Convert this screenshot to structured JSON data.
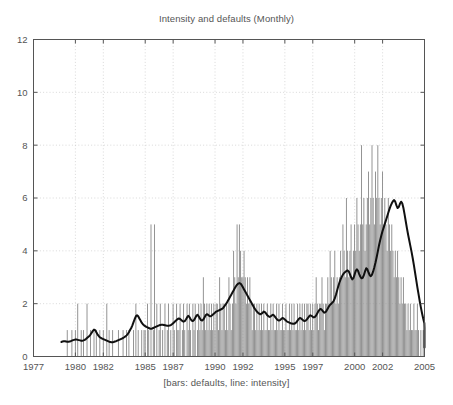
{
  "chart_data": {
    "type": "bar",
    "title": "Intensity and defaults (Monthly)",
    "xlabel": "[bars: defaults, line: intensity]",
    "ylabel": "",
    "grid": true,
    "legend": "none",
    "legend_note": "[bars: defaults, line: intensity]",
    "xlim": [
      1977,
      2005
    ],
    "ylim": [
      0,
      12
    ],
    "yticks": [
      0,
      2,
      4,
      6,
      8,
      10,
      12
    ],
    "ytick_labels": [
      "0",
      "2",
      "4",
      "6",
      "8",
      "10",
      "12"
    ],
    "xticks": [
      1977,
      1980,
      1982,
      1985,
      1987,
      1990,
      1992,
      1995,
      1997,
      2000,
      2002,
      2005
    ],
    "xtick_labels": [
      "1977",
      "1980",
      "1982",
      "1985",
      "1987",
      "1990",
      "1992",
      "1995",
      "1997",
      "2000",
      "2002",
      "2005"
    ],
    "bar_color": "#8c8c8c",
    "line_color": "#101010",
    "axis_color": "#555555",
    "grid_color": "#c8c8c8",
    "series": [
      {
        "name": "defaults",
        "type": "bar",
        "x_start": 1979.0,
        "x_step": 0.0833,
        "values": [
          0,
          0,
          0,
          0,
          0,
          1,
          0,
          0,
          0,
          1,
          0,
          0,
          1,
          0,
          2,
          0,
          0,
          1,
          0,
          1,
          0,
          0,
          2,
          0,
          0,
          1,
          0,
          0,
          1,
          0,
          1,
          0,
          0,
          1,
          0,
          0,
          1,
          0,
          0,
          2,
          0,
          1,
          0,
          0,
          1,
          0,
          0,
          0,
          0,
          1,
          0,
          0,
          0,
          1,
          0,
          0,
          1,
          0,
          1,
          0,
          0,
          0,
          1,
          0,
          2,
          0,
          1,
          0,
          0,
          1,
          0,
          1,
          1,
          0,
          2,
          1,
          0,
          5,
          0,
          1,
          5,
          0,
          2,
          0,
          1,
          2,
          0,
          1,
          0,
          2,
          0,
          1,
          2,
          0,
          1,
          0,
          2,
          1,
          0,
          2,
          1,
          1,
          2,
          0,
          1,
          2,
          1,
          0,
          2,
          1,
          2,
          1,
          0,
          2,
          1,
          2,
          0,
          1,
          2,
          1,
          2,
          1,
          3,
          2,
          1,
          2,
          1,
          2,
          1,
          2,
          1,
          2,
          1,
          2,
          2,
          1,
          3,
          2,
          1,
          2,
          2,
          1,
          2,
          1,
          3,
          2,
          1,
          2,
          4,
          3,
          2,
          5,
          3,
          5,
          4,
          3,
          3,
          4,
          3,
          2,
          3,
          2,
          3,
          2,
          1,
          2,
          2,
          1,
          2,
          1,
          2,
          1,
          2,
          1,
          2,
          1,
          1,
          2,
          1,
          1,
          2,
          1,
          2,
          1,
          1,
          2,
          1,
          2,
          1,
          1,
          2,
          1,
          1,
          2,
          1,
          1,
          2,
          1,
          2,
          1,
          2,
          1,
          1,
          2,
          1,
          2,
          1,
          2,
          1,
          2,
          1,
          2,
          2,
          1,
          2,
          1,
          2,
          1,
          2,
          3,
          2,
          1,
          2,
          2,
          3,
          2,
          1,
          2,
          2,
          3,
          2,
          4,
          3,
          2,
          3,
          4,
          2,
          3,
          2,
          3,
          4,
          3,
          5,
          4,
          3,
          6,
          4,
          3,
          4,
          5,
          3,
          4,
          5,
          4,
          6,
          5,
          4,
          5,
          8,
          5,
          6,
          4,
          5,
          6,
          7,
          5,
          6,
          8,
          6,
          5,
          7,
          6,
          8,
          6,
          5,
          6,
          7,
          5,
          6,
          5,
          4,
          6,
          5,
          4,
          5,
          4,
          3,
          4,
          3,
          4,
          3,
          2,
          3,
          2,
          3,
          2,
          2,
          1,
          2,
          1,
          2,
          1,
          1,
          2,
          1,
          1,
          2,
          1,
          0,
          1,
          0,
          1,
          0,
          0,
          1,
          0,
          0,
          0,
          0,
          0,
          0,
          0,
          0,
          0
        ]
      },
      {
        "name": "intensity",
        "type": "line",
        "x_start": 1979.0,
        "x_step": 0.0833,
        "values": [
          0.55,
          0.57,
          0.58,
          0.58,
          0.57,
          0.56,
          0.56,
          0.57,
          0.58,
          0.6,
          0.62,
          0.63,
          0.64,
          0.64,
          0.63,
          0.62,
          0.61,
          0.6,
          0.6,
          0.61,
          0.63,
          0.66,
          0.7,
          0.74,
          0.78,
          0.83,
          0.9,
          0.97,
          1.02,
          1.0,
          0.92,
          0.84,
          0.78,
          0.73,
          0.7,
          0.68,
          0.66,
          0.64,
          0.62,
          0.6,
          0.58,
          0.56,
          0.55,
          0.54,
          0.54,
          0.55,
          0.57,
          0.58,
          0.6,
          0.62,
          0.64,
          0.66,
          0.68,
          0.7,
          0.73,
          0.76,
          0.8,
          0.85,
          0.92,
          1.0,
          1.08,
          1.18,
          1.3,
          1.42,
          1.52,
          1.56,
          1.52,
          1.44,
          1.36,
          1.28,
          1.22,
          1.18,
          1.15,
          1.12,
          1.1,
          1.08,
          1.06,
          1.05,
          1.06,
          1.08,
          1.1,
          1.12,
          1.14,
          1.16,
          1.18,
          1.19,
          1.2,
          1.2,
          1.19,
          1.18,
          1.17,
          1.16,
          1.16,
          1.17,
          1.19,
          1.22,
          1.26,
          1.3,
          1.34,
          1.38,
          1.42,
          1.44,
          1.42,
          1.38,
          1.34,
          1.32,
          1.34,
          1.4,
          1.48,
          1.54,
          1.5,
          1.42,
          1.36,
          1.34,
          1.38,
          1.46,
          1.54,
          1.58,
          1.52,
          1.44,
          1.38,
          1.36,
          1.4,
          1.48,
          1.56,
          1.6,
          1.58,
          1.54,
          1.52,
          1.54,
          1.58,
          1.62,
          1.66,
          1.7,
          1.72,
          1.74,
          1.76,
          1.78,
          1.8,
          1.84,
          1.9,
          1.96,
          2.02,
          2.1,
          2.18,
          2.26,
          2.34,
          2.42,
          2.5,
          2.58,
          2.66,
          2.72,
          2.76,
          2.78,
          2.76,
          2.7,
          2.62,
          2.54,
          2.46,
          2.38,
          2.3,
          2.22,
          2.14,
          2.06,
          1.98,
          1.9,
          1.82,
          1.76,
          1.7,
          1.66,
          1.62,
          1.6,
          1.62,
          1.66,
          1.7,
          1.68,
          1.62,
          1.56,
          1.52,
          1.5,
          1.52,
          1.56,
          1.58,
          1.54,
          1.48,
          1.42,
          1.38,
          1.36,
          1.38,
          1.42,
          1.46,
          1.44,
          1.4,
          1.36,
          1.32,
          1.3,
          1.28,
          1.26,
          1.25,
          1.24,
          1.24,
          1.26,
          1.3,
          1.36,
          1.42,
          1.46,
          1.44,
          1.4,
          1.36,
          1.34,
          1.36,
          1.4,
          1.46,
          1.52,
          1.56,
          1.54,
          1.5,
          1.48,
          1.5,
          1.56,
          1.64,
          1.72,
          1.78,
          1.8,
          1.76,
          1.7,
          1.66,
          1.68,
          1.74,
          1.82,
          1.9,
          1.96,
          2.0,
          2.04,
          2.1,
          2.2,
          2.34,
          2.5,
          2.66,
          2.8,
          2.92,
          3.02,
          3.1,
          3.16,
          3.2,
          3.24,
          3.26,
          3.22,
          3.12,
          3.0,
          2.92,
          2.96,
          3.1,
          3.24,
          3.3,
          3.24,
          3.12,
          3.02,
          2.96,
          2.98,
          3.08,
          3.22,
          3.34,
          3.3,
          3.18,
          3.08,
          3.04,
          3.1,
          3.22,
          3.38,
          3.56,
          3.76,
          3.98,
          4.2,
          4.4,
          4.58,
          4.74,
          4.88,
          5.02,
          5.16,
          5.3,
          5.44,
          5.58,
          5.7,
          5.8,
          5.88,
          5.92,
          5.86,
          5.72,
          5.62,
          5.66,
          5.78,
          5.86,
          5.8,
          5.62,
          5.38,
          5.12,
          4.86,
          4.62,
          4.4,
          4.18,
          3.96,
          3.72,
          3.46,
          3.18,
          2.9,
          2.62,
          2.36,
          2.1,
          1.86,
          1.64,
          1.44,
          1.26,
          1.1,
          0.96,
          0.84,
          0.74,
          0.66,
          0.58,
          0.52,
          0.46,
          0.4,
          0.36,
          0.34
        ]
      }
    ]
  }
}
